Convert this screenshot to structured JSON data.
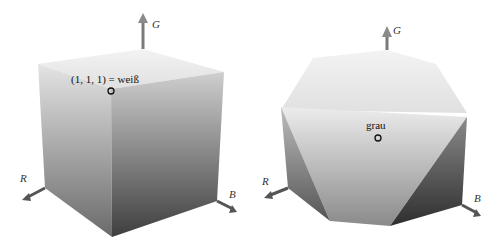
{
  "figures": [
    {
      "name": "rgb-cube",
      "point_label": "(1, 1, 1) = weiß",
      "axes": {
        "g": "G",
        "r": "R",
        "b": "B"
      }
    },
    {
      "name": "truncated-cube",
      "point_label": "grau",
      "axes": {
        "g": "G",
        "r": "R",
        "b": "B"
      }
    }
  ],
  "colors": {
    "light": "#f2f2f2",
    "mid": "#b8b8b8",
    "dark": "#4a4a4a",
    "arrow": "#6b6b6b"
  }
}
